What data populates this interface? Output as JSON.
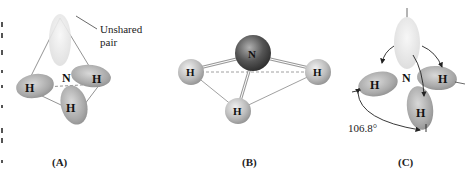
{
  "figure": {
    "panels": [
      {
        "id": "A",
        "caption": "(A)",
        "central_atom": "N",
        "hydrogens": [
          "H",
          "H",
          "H"
        ],
        "annotation": [
          "Unshared",
          "pair"
        ]
      },
      {
        "id": "B",
        "caption": "(B)",
        "central_atom": "N",
        "hydrogens": [
          "H",
          "H",
          "H"
        ]
      },
      {
        "id": "C",
        "caption": "(C)",
        "central_atom": "N",
        "hydrogens": [
          "H",
          "H",
          "H"
        ],
        "bond_angle": "106.8°"
      }
    ]
  }
}
